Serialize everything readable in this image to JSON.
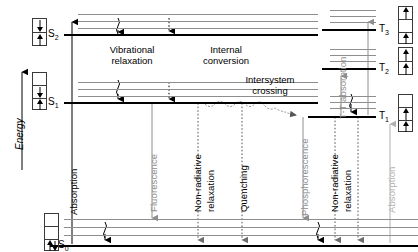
{
  "figure": {
    "type": "jablonski-energy-diagram",
    "axis_label": "Energy",
    "axis_direction": "up"
  },
  "states": {
    "singlets": [
      {
        "id": "S2",
        "label": "S",
        "sub": "2",
        "y": 34,
        "vibrational_levels": 3
      },
      {
        "id": "S1",
        "label": "S",
        "sub": "1",
        "y": 102,
        "vibrational_levels": 3
      },
      {
        "id": "S0",
        "label": "S",
        "sub": "0",
        "y": 245,
        "vibrational_levels": 3
      }
    ],
    "triplets": [
      {
        "id": "T3",
        "label": "T",
        "sub": "3",
        "y": 29,
        "vibrational_levels": 3
      },
      {
        "id": "T2",
        "label": "T",
        "sub": "2",
        "y": 68,
        "vibrational_levels": 3
      },
      {
        "id": "T1",
        "label": "T",
        "sub": "1",
        "y": 116,
        "vibrational_levels": 3
      }
    ]
  },
  "spin_configurations": {
    "S2": {
      "cells": [
        "down",
        "up"
      ]
    },
    "S1": {
      "cells": [
        "empty",
        "down",
        "up"
      ]
    },
    "S0": {
      "cells": [
        "empty",
        "empty",
        "updown"
      ]
    },
    "T3": {
      "cells": [
        "up",
        "empty",
        "up"
      ]
    },
    "T2": {
      "cells": [
        "up",
        "up"
      ]
    },
    "T1": {
      "cells": [
        "empty",
        "up",
        "up"
      ]
    }
  },
  "process_boxes": [
    {
      "id": "vibrational-relaxation",
      "line1": "Vibrational",
      "line2": "relaxation"
    },
    {
      "id": "internal-conversion",
      "line1": "Internal",
      "line2": "conversion"
    },
    {
      "id": "intersystem-crossing",
      "line1": "Intersystem",
      "line2": "crossing"
    }
  ],
  "process_labels": [
    {
      "id": "absorption",
      "text": "Absorption",
      "color": "#000000"
    },
    {
      "id": "fluorescence",
      "text": "Fluorescence",
      "color": "#8e8e8e"
    },
    {
      "id": "non-radiative-relaxation-1-line1",
      "text": "Non-radiative",
      "color": "#000000"
    },
    {
      "id": "non-radiative-relaxation-1-line2",
      "text": "relaxation",
      "color": "#000000"
    },
    {
      "id": "quenching",
      "text": "Quenching",
      "color": "#000000"
    },
    {
      "id": "phosphorescence",
      "text": "Phosphorescence",
      "color": "#8e8e8e"
    },
    {
      "id": "non-radiative-relaxation-2-line1",
      "text": "Non-radiative",
      "color": "#000000"
    },
    {
      "id": "non-radiative-relaxation-2-line2",
      "text": "relaxation",
      "color": "#000000"
    },
    {
      "id": "tt-absorption",
      "text": "T-T absorption",
      "color": "#8e8e8e"
    },
    {
      "id": "absorption-triplet",
      "text": "Absorption",
      "color": "#b0b0b0"
    }
  ],
  "colors": {
    "level_main": "#000000",
    "level_vibrational": "#8e8e8e",
    "arrow_black": "#000000",
    "arrow_gray": "#8e8e8e",
    "arrow_light_gray": "#b0b0b0",
    "background": "#ffffff"
  }
}
